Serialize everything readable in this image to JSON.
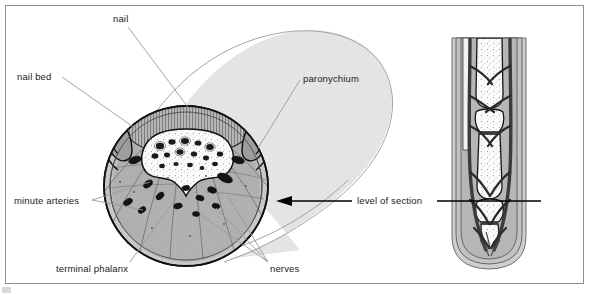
{
  "figure": {
    "background_color": "#ffffff",
    "frame_color": "#8d8f91",
    "label_color": "#1b1b1b",
    "leader_line_color": "#9a9a9a",
    "arrow_color": "#000000",
    "ghost_finger_color": "#e3e3e3",
    "soft_tissue_color": "#b4b4b4",
    "bone_color": "#fbfbfb",
    "vessel_color": "#1a1a1a"
  },
  "labels": {
    "nail": "nail",
    "nail_bed": "nail bed",
    "paronychium": "paronychium",
    "minute_arteries": "minute arteries",
    "terminal_phalanx": "terminal phalanx",
    "nerves": "nerves",
    "level_of_section": "level of section"
  },
  "panels": {
    "left": {
      "name": "cross-section-of-fingertip",
      "view": "transverse cross-section through distal phalanx",
      "structures": [
        "nail plate",
        "nail bed",
        "paronychium (lateral nail fold)",
        "terminal phalanx (bone)",
        "minute arteries",
        "nerves",
        "fibrous septa of pulp"
      ]
    },
    "right": {
      "name": "longitudinal-section-of-finger",
      "view": "longitudinal section of finger showing phalanges and neurovascular bundles",
      "structures": [
        "phalanges",
        "interphalangeal joints",
        "digital arteries",
        "digital nerves",
        "nail",
        "pulp"
      ]
    }
  },
  "annotations": {
    "section_marker": "horizontal line across longitudinal view indicating the plane of the cross-section",
    "section_arrow": "arrow pointing left from 'level of section' toward the cross-section"
  }
}
